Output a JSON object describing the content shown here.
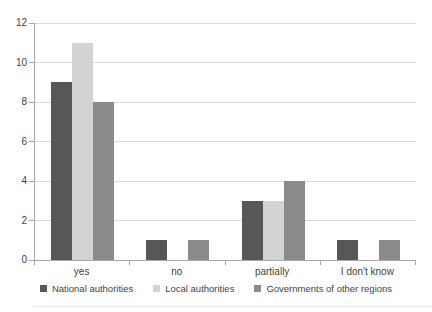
{
  "chart_data": {
    "type": "bar",
    "title": "",
    "xlabel": "",
    "ylabel": "",
    "categories": [
      "yes",
      "no",
      "partially",
      "I don't know"
    ],
    "series": [
      {
        "name": "National authorities",
        "values": [
          9,
          1,
          3,
          1
        ]
      },
      {
        "name": "Local authorities",
        "values": [
          11,
          0,
          3,
          0
        ]
      },
      {
        "name": "Governments of other regions",
        "values": [
          8,
          1,
          4,
          1
        ]
      }
    ],
    "ylim": [
      0,
      12
    ],
    "yticks": [
      0,
      2,
      4,
      6,
      8,
      10,
      12
    ],
    "grid": true,
    "legend_position": "bottom"
  },
  "colors": {
    "background": "#ffffff",
    "grid": "#d9d9d9",
    "axis": "#a8a8a8",
    "text": "#3f3f3f",
    "series_colors": [
      "#575757",
      "#d3d3d3",
      "#8a8a8a"
    ]
  }
}
